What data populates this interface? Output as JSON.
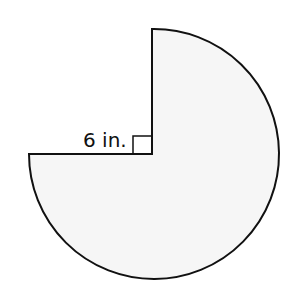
{
  "diagram": {
    "type": "three-quarter circle sector",
    "shape_description": "Circle with one quarter removed (upper-left quadrant), leaving a 270-degree sector",
    "radius_label": "6 in.",
    "right_angle_marker": true,
    "colors": {
      "fill": "#f6f6f6",
      "stroke": "#111111",
      "background": "#ffffff"
    }
  }
}
